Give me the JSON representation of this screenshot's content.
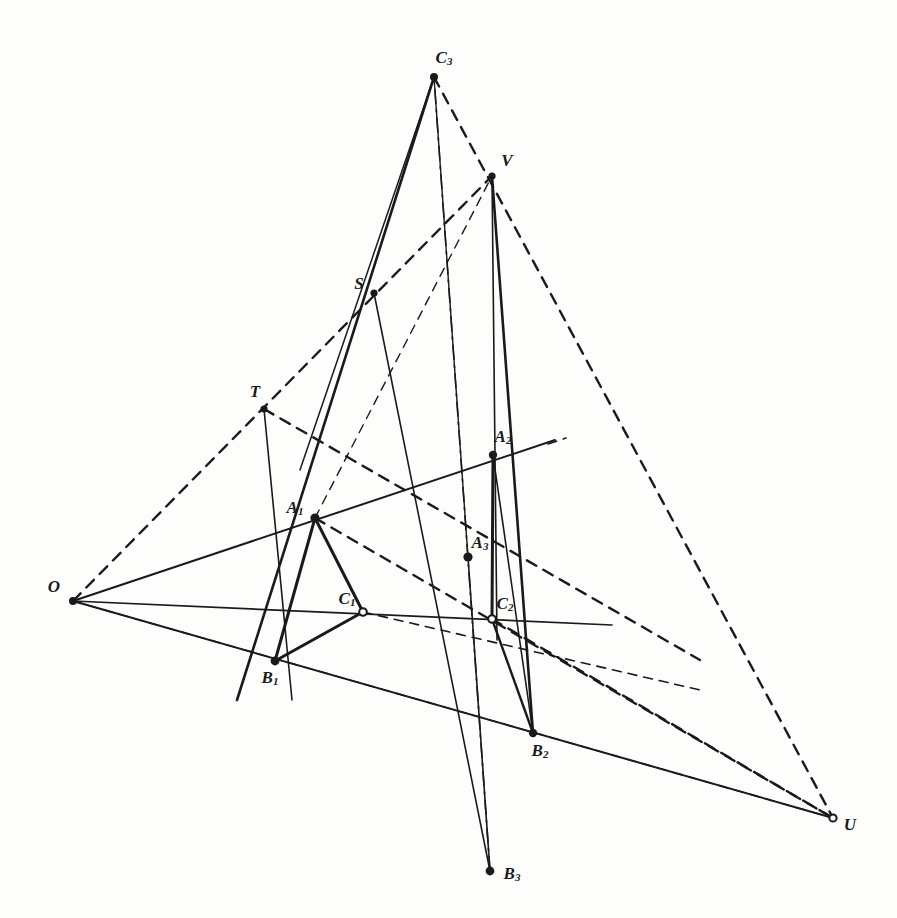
{
  "figure": {
    "background_color": "#fdfdfb",
    "ink_color": "#1a1a1a",
    "width": 897,
    "height": 918,
    "points": [
      {
        "id": "O",
        "label": "O",
        "sub": "",
        "x": 73,
        "y": 601,
        "lx": 54,
        "ly": 586,
        "marker": "dot",
        "r": 4.0
      },
      {
        "id": "T",
        "label": "T",
        "sub": "",
        "x": 264,
        "y": 409,
        "lx": 255,
        "ly": 391,
        "marker": "dot",
        "r": 3.6
      },
      {
        "id": "S",
        "label": "S",
        "sub": "",
        "x": 374,
        "y": 293,
        "lx": 359,
        "ly": 283,
        "marker": "dot",
        "r": 3.6
      },
      {
        "id": "V",
        "label": "V",
        "sub": "",
        "x": 492,
        "y": 176,
        "lx": 507,
        "ly": 160,
        "marker": "dot",
        "r": 3.6
      },
      {
        "id": "U",
        "label": "U",
        "sub": "",
        "x": 833,
        "y": 818,
        "lx": 850,
        "ly": 824,
        "marker": "ring",
        "r": 3.6
      },
      {
        "id": "C3",
        "label": "C",
        "sub": "3",
        "x": 434,
        "y": 77,
        "lx": 444,
        "ly": 58,
        "marker": "dot",
        "r": 4.0
      },
      {
        "id": "A1",
        "label": "A",
        "sub": "1",
        "x": 315,
        "y": 518,
        "lx": 295,
        "ly": 508,
        "marker": "dot",
        "r": 4.6
      },
      {
        "id": "A2",
        "label": "A",
        "sub": "2",
        "x": 493,
        "y": 455,
        "lx": 503,
        "ly": 437,
        "marker": "dot",
        "r": 4.2
      },
      {
        "id": "A3",
        "label": "A",
        "sub": "3",
        "x": 468,
        "y": 557,
        "lx": 480,
        "ly": 543,
        "marker": "dot",
        "r": 4.6
      },
      {
        "id": "B1",
        "label": "B",
        "sub": "1",
        "x": 275,
        "y": 661,
        "lx": 270,
        "ly": 678,
        "marker": "dot",
        "r": 4.4
      },
      {
        "id": "B2",
        "label": "B",
        "sub": "2",
        "x": 533,
        "y": 733,
        "lx": 540,
        "ly": 751,
        "marker": "dot",
        "r": 4.2
      },
      {
        "id": "B3",
        "label": "B",
        "sub": "3",
        "x": 490,
        "y": 871,
        "lx": 512,
        "ly": 874,
        "marker": "dot",
        "r": 4.4
      },
      {
        "id": "C1",
        "label": "C",
        "sub": "1",
        "x": 363,
        "y": 612,
        "lx": 347,
        "ly": 599,
        "marker": "ring",
        "r": 3.8
      },
      {
        "id": "C2",
        "label": "C",
        "sub": "2",
        "x": 492,
        "y": 619,
        "lx": 505,
        "ly": 604,
        "marker": "ring",
        "r": 3.8
      }
    ],
    "segments": [
      {
        "name": "perspectivity-ray-O-A1-A2",
        "from": [
          73,
          601
        ],
        "to": [
          555,
          440
        ],
        "style": "solid",
        "w": 2.0
      },
      {
        "name": "perspectivity-ray-O-C1-C2",
        "from": [
          73,
          601
        ],
        "to": [
          612,
          625
        ],
        "style": "solid",
        "w": 1.7
      },
      {
        "name": "perspectivity-ray-O-B1-B2-U",
        "from": [
          73,
          601
        ],
        "to": [
          833,
          818
        ],
        "style": "solid",
        "w": 2.0
      },
      {
        "name": "triangle-side-A1-B1",
        "from": [
          315,
          518
        ],
        "to": [
          275,
          661
        ],
        "style": "solid",
        "w": 3.0
      },
      {
        "name": "triangle-side-B1-C1",
        "from": [
          275,
          661
        ],
        "to": [
          363,
          612
        ],
        "style": "solid",
        "w": 3.0
      },
      {
        "name": "triangle-side-C1-A1",
        "from": [
          363,
          612
        ],
        "to": [
          315,
          518
        ],
        "style": "solid",
        "w": 3.0
      },
      {
        "name": "triangle-side-A2-B2",
        "from": [
          493,
          455
        ],
        "to": [
          533,
          733
        ],
        "style": "solid",
        "w": 1.6
      },
      {
        "name": "triangle-side-B2-C2",
        "from": [
          533,
          733
        ],
        "to": [
          492,
          619
        ],
        "style": "solid",
        "w": 2.4
      },
      {
        "name": "triangle-side-C2-A2",
        "from": [
          492,
          619
        ],
        "to": [
          493,
          455
        ],
        "style": "solid",
        "w": 3.0
      },
      {
        "name": "triangle-side-A3-B3",
        "from": [
          468,
          557
        ],
        "to": [
          490,
          871
        ],
        "style": "solid",
        "w": 1.6
      },
      {
        "name": "triangle-side-B3-C3",
        "from": [
          490,
          871
        ],
        "to": [
          434,
          77
        ],
        "style": "dashdot",
        "w": 1.6
      },
      {
        "name": "triangle-side-C3-A3",
        "from": [
          434,
          77
        ],
        "to": [
          468,
          557
        ],
        "style": "solid",
        "w": 1.4
      },
      {
        "name": "line-C3-S-B1-extended",
        "from": [
          434,
          77
        ],
        "to": [
          237,
          700
        ],
        "style": "solid",
        "w": 2.6
      },
      {
        "name": "line-C3-A1-B3-extended",
        "from": [
          434,
          77
        ],
        "to": [
          300,
          470
        ],
        "style": "solid",
        "w": 1.5
      },
      {
        "name": "line-S-A1-B3",
        "from": [
          374,
          293
        ],
        "to": [
          490,
          871
        ],
        "style": "solid",
        "w": 1.6
      },
      {
        "name": "line-T-A1-B1-lower",
        "from": [
          264,
          409
        ],
        "to": [
          292,
          700
        ],
        "style": "solid",
        "w": 1.6
      },
      {
        "name": "line-V-B2-vertical",
        "from": [
          492,
          176
        ],
        "to": [
          533,
          733
        ],
        "style": "solid",
        "w": 2.6
      },
      {
        "name": "line-V-A2-C2-B3",
        "from": [
          492,
          176
        ],
        "to": [
          497,
          640
        ],
        "style": "solid",
        "w": 1.6
      },
      {
        "name": "axis-line-T-A3-right",
        "from": [
          264,
          409
        ],
        "to": [
          700,
          660
        ],
        "style": "dashed",
        "w": 2.4
      },
      {
        "name": "axis-dashed-O-T-S-V",
        "from": [
          73,
          601
        ],
        "to": [
          492,
          176
        ],
        "style": "dashed",
        "w": 2.4
      },
      {
        "name": "axis-dashed-C3-V-U",
        "from": [
          434,
          77
        ],
        "to": [
          833,
          818
        ],
        "style": "dashed",
        "w": 2.4
      },
      {
        "name": "axis-dashed-O-A3-U",
        "from": [
          73,
          601
        ],
        "to": [
          833,
          818
        ],
        "style": "dashed",
        "w": 1.4
      },
      {
        "name": "axis-dashed-A1-A3-U",
        "from": [
          315,
          518
        ],
        "to": [
          833,
          818
        ],
        "style": "dashed",
        "w": 2.4
      },
      {
        "name": "axis-dashed-C2-U",
        "from": [
          492,
          619
        ],
        "to": [
          833,
          818
        ],
        "style": "dashed",
        "w": 2.4
      },
      {
        "name": "axis-dashed-A1-S-V-up",
        "from": [
          315,
          518
        ],
        "to": [
          492,
          176
        ],
        "style": "dashed",
        "w": 1.4
      },
      {
        "name": "axis-dashed-C1-C2-right",
        "from": [
          363,
          612
        ],
        "to": [
          700,
          690
        ],
        "style": "dashed",
        "w": 1.6
      },
      {
        "name": "tick-A2-right-stub",
        "from": [
          548,
          444
        ],
        "to": [
          566,
          438
        ],
        "style": "dashed",
        "w": 1.6
      }
    ]
  }
}
